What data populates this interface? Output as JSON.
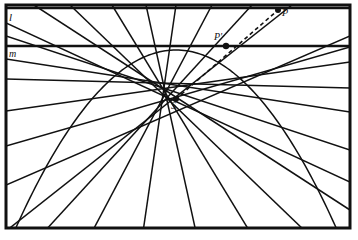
{
  "figure": {
    "type": "geometric-construction",
    "width": 358,
    "height": 240,
    "background": "#ffffff",
    "ink": "#111111",
    "border": {
      "name": "figure-frame",
      "x": 6,
      "y": 5,
      "width": 344,
      "height": 223,
      "stroke_width": 3
    },
    "labels": {
      "line_l": "l",
      "line_m": "m",
      "point_P": "P",
      "point_P_prime": "P'",
      "point_S": "S"
    },
    "lines": [
      {
        "name": "line-l",
        "label": "l",
        "y": 8,
        "x1": 6,
        "x2": 350,
        "stroke_width": 2.6
      },
      {
        "name": "line-m",
        "label": "m",
        "y": 46,
        "x1": 6,
        "x2": 350,
        "stroke_width": 2.6
      }
    ],
    "points": [
      {
        "name": "point-P",
        "label": "P",
        "x": 278,
        "y": 10,
        "r": 3.0
      },
      {
        "name": "point-P-prime",
        "label": "P'",
        "x": 226,
        "y": 46,
        "r": 3.2
      },
      {
        "name": "point-S",
        "label": "S",
        "x": 176,
        "y": 99,
        "r": 3.0
      }
    ],
    "dashed_ray": {
      "name": "dashed-ray-S-P",
      "from": [
        176,
        99
      ],
      "to": [
        278,
        10
      ],
      "dash": "4,3"
    },
    "parabola": {
      "name": "parabola-curve",
      "vertex": [
        176,
        50
      ],
      "left_end": [
        14,
        232
      ],
      "right_end": [
        338,
        232
      ],
      "opens": "down",
      "stroke_width": 1.5
    },
    "tangents": [
      {
        "name": "tangent-line",
        "x1": 6,
        "y1": 23,
        "x2": 350,
        "y2": 182
      },
      {
        "name": "tangent-line",
        "x1": 6,
        "y1": 36,
        "x2": 350,
        "y2": 150
      },
      {
        "name": "tangent-line",
        "x1": 6,
        "y1": 59,
        "x2": 350,
        "y2": 112
      },
      {
        "name": "tangent-line",
        "x1": 6,
        "y1": 79,
        "x2": 350,
        "y2": 88
      },
      {
        "name": "tangent-line",
        "x1": 6,
        "y1": 111,
        "x2": 350,
        "y2": 62
      },
      {
        "name": "tangent-line",
        "x1": 6,
        "y1": 146,
        "x2": 350,
        "y2": 47
      },
      {
        "name": "tangent-line",
        "x1": 6,
        "y1": 185,
        "x2": 350,
        "y2": 36
      },
      {
        "name": "tangent-line",
        "x1": 6,
        "y1": 231,
        "x2": 292,
        "y2": 5
      },
      {
        "name": "tangent-line",
        "x1": 44,
        "y1": 232,
        "x2": 252,
        "y2": 5
      },
      {
        "name": "tangent-line",
        "x1": 92,
        "y1": 232,
        "x2": 212,
        "y2": 5
      },
      {
        "name": "tangent-line",
        "x1": 143,
        "y1": 232,
        "x2": 176,
        "y2": 5
      },
      {
        "name": "tangent-line",
        "x1": 196,
        "y1": 232,
        "x2": 146,
        "y2": 5
      },
      {
        "name": "tangent-line",
        "x1": 250,
        "y1": 232,
        "x2": 112,
        "y2": 5
      },
      {
        "name": "tangent-line",
        "x1": 306,
        "y1": 232,
        "x2": 70,
        "y2": 5
      },
      {
        "name": "tangent-line",
        "x1": 350,
        "y1": 210,
        "x2": 34,
        "y2": 5
      }
    ]
  }
}
